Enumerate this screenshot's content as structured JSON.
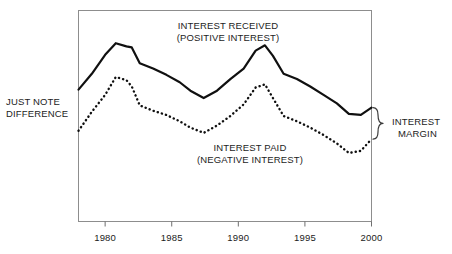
{
  "figure": {
    "background_color": "#ffffff",
    "frame_color": "#8a8a8a",
    "line_color": "#101010"
  },
  "labels": {
    "left_caption_line1": "JUST NOTE",
    "left_caption_line2": "DIFFERENCE",
    "right_caption_line1": "INTEREST",
    "right_caption_line2": "MARGIN",
    "received_line1": "INTEREST RECEIVED",
    "received_line2": "(POSITIVE INTEREST)",
    "paid_line1": "INTEREST PAID",
    "paid_line2": "(NEGATIVE INTEREST)"
  },
  "chart_data": {
    "type": "line",
    "title": "",
    "subtitle": "",
    "xlabel": "",
    "ylabel": "",
    "grid": false,
    "legend_position": "inline-annotation",
    "xlim": [
      1978,
      2000
    ],
    "ylim": [
      0,
      100
    ],
    "xticks": [
      1980,
      1985,
      1990,
      1995,
      2000
    ],
    "xtick_labels": [
      "1980",
      "1985",
      "1990",
      "1995",
      "2000"
    ],
    "yticks": [],
    "ytick_labels": [],
    "annotations": [
      {
        "text": "JUST NOTE DIFFERENCE",
        "position": "left-outside"
      },
      {
        "text": "INTEREST MARGIN",
        "position": "right-outside-brace"
      },
      {
        "text": "INTEREST RECEIVED (POSITIVE INTEREST)",
        "position": "top-inside"
      },
      {
        "text": "INTEREST PAID (NEGATIVE INTEREST)",
        "position": "bottom-inside"
      }
    ],
    "series": [
      {
        "name": "INTEREST RECEIVED (POSITIVE INTEREST)",
        "style": "solid",
        "color": "#101010",
        "x": [
          1978.0,
          1979.0,
          1980.0,
          1980.8,
          1981.6,
          1982.0,
          1982.6,
          1983.6,
          1984.6,
          1985.6,
          1986.4,
          1987.4,
          1988.4,
          1989.4,
          1990.4,
          1991.3,
          1992.0,
          1992.6,
          1993.4,
          1994.4,
          1995.4,
          1996.4,
          1997.4,
          1998.3,
          1999.2,
          2000.0
        ],
        "values": [
          62.5,
          70.0,
          79.0,
          84.5,
          83.0,
          82.5,
          75.0,
          72.5,
          69.5,
          66.0,
          62.0,
          58.5,
          62.0,
          67.5,
          72.5,
          81.0,
          83.5,
          78.5,
          70.0,
          67.5,
          64.0,
          60.0,
          56.0,
          51.0,
          50.5,
          54.0
        ]
      },
      {
        "name": "INTEREST PAID (NEGATIVE INTEREST)",
        "style": "dotted",
        "color": "#101010",
        "x": [
          1978.0,
          1979.0,
          1980.0,
          1980.8,
          1981.6,
          1982.0,
          1982.6,
          1983.6,
          1984.6,
          1985.6,
          1986.4,
          1987.4,
          1988.4,
          1989.4,
          1990.4,
          1991.3,
          1992.0,
          1992.6,
          1993.4,
          1994.4,
          1995.4,
          1996.4,
          1997.4,
          1998.3,
          1999.2,
          2000.0
        ],
        "values": [
          43.0,
          52.0,
          60.0,
          68.5,
          67.0,
          64.0,
          55.0,
          52.5,
          50.5,
          47.5,
          44.5,
          42.0,
          45.5,
          50.0,
          55.5,
          63.5,
          65.0,
          58.5,
          50.0,
          47.5,
          44.5,
          41.0,
          37.0,
          32.5,
          33.5,
          39.0
        ]
      }
    ],
    "margin_band": {
      "label": "INTEREST MARGIN",
      "at_x": 2000,
      "top_value": 54.0,
      "bottom_value": 39.0
    }
  }
}
